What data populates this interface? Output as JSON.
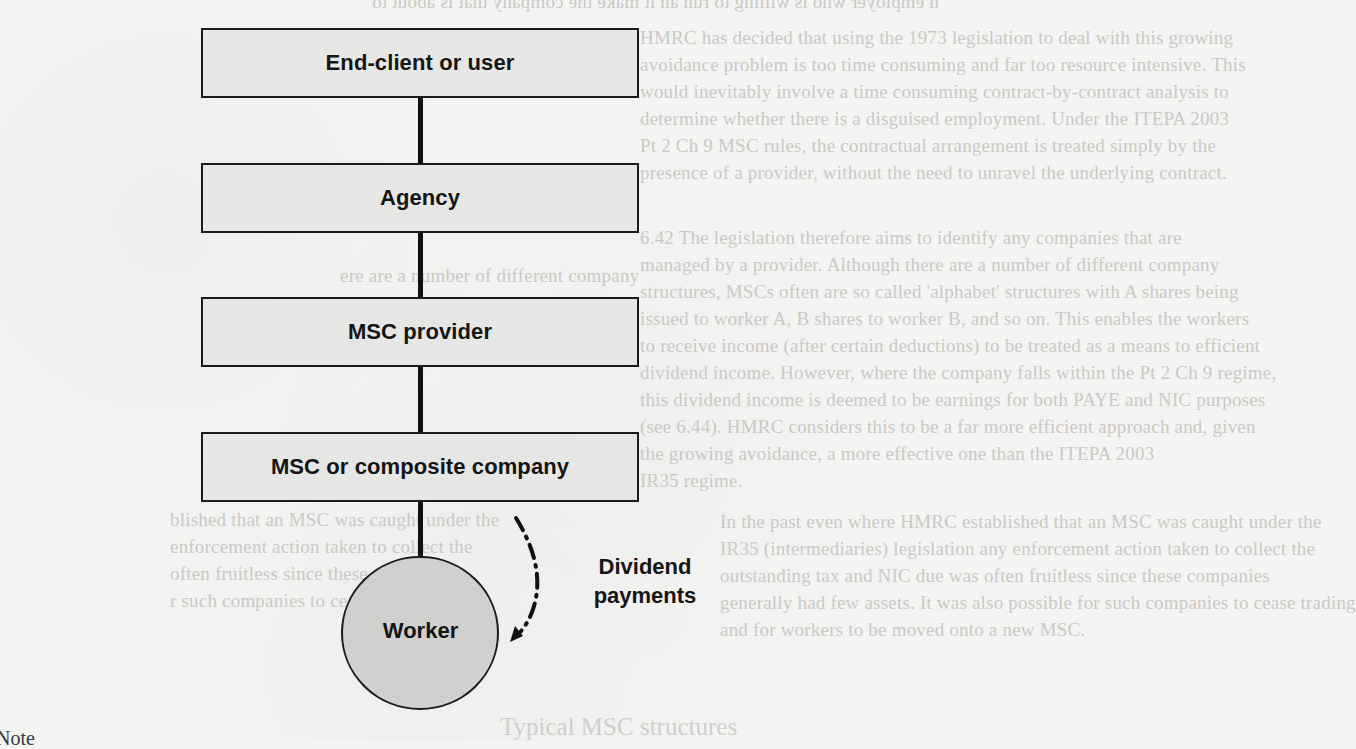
{
  "diagram": {
    "type": "hierarchy-flow",
    "nodes": [
      {
        "id": "end-client",
        "label": "End-client or user",
        "shape": "rectangle"
      },
      {
        "id": "agency",
        "label": "Agency",
        "shape": "rectangle"
      },
      {
        "id": "msc-provider",
        "label": "MSC provider",
        "shape": "rectangle"
      },
      {
        "id": "msc-company",
        "label": "MSC or composite company",
        "shape": "rectangle"
      },
      {
        "id": "worker",
        "label": "Worker",
        "shape": "circle"
      }
    ],
    "edges": [
      {
        "from": "end-client",
        "to": "agency",
        "style": "solid"
      },
      {
        "from": "agency",
        "to": "msc-provider",
        "style": "solid"
      },
      {
        "from": "msc-provider",
        "to": "msc-company",
        "style": "solid"
      },
      {
        "from": "msc-company",
        "to": "worker",
        "style": "solid"
      },
      {
        "from": "msc-company",
        "to": "worker",
        "style": "dash-dot-arrow",
        "label": "Dividend payments"
      }
    ],
    "annotation": {
      "line1": "Dividend",
      "line2": "payments"
    },
    "colors": {
      "box_fill": "#e2e2e0",
      "circle_fill": "#cfcfcd",
      "stroke": "#1b1b1b",
      "page": "#f4f4f2"
    }
  },
  "page_fragments": {
    "note_fragment": "Note",
    "ghost_heading": "Typical MSC structures",
    "ghost_lines": [
      "n employer who is willing to run an it make the company that is about to",
      "HMRC has decided that using the 1973 legislation to deal with this growing",
      "avoidance problem is too time consuming and far too resource intensive. This",
      "would inevitably involve a time consuming contract-by-contract analysis to",
      "determine whether there is a disguised employment. Under the ITEPA 2003",
      "Pt 2 Ch 9 MSC rules, the contractual arrangement is treated simply by the",
      "presence of a provider, without the need to unravel the underlying contract.",
      "6.42     The legislation therefore aims to identify any companies that are",
      "managed by a provider. Although there are a number of different company",
      "structures, MSCs often are so called 'alphabet' structures with A shares being",
      "issued to worker A, B shares to worker B, and so on. This enables the workers",
      "to receive income (after certain deductions) to be treated as a means to efficient",
      "dividend income. However, where the company falls within the Pt 2 Ch 9 regime,",
      "this dividend income is deemed to be earnings for both PAYE and NIC purposes",
      "(see 6.44). HMRC considers this to be a far more efficient approach and, given",
      "the growing avoidance, a more effective one than the ITEPA 2003",
      "IR35 regime.",
      "In the past even where HMRC established that an MSC was caught under the",
      "IR35 (intermediaries) legislation any enforcement action taken to collect the",
      "outstanding tax and NIC due was often fruitless since these companies",
      "generally had few assets. It was also possible for such companies to cease trading",
      "and for workers to be moved onto a new MSC."
    ]
  }
}
